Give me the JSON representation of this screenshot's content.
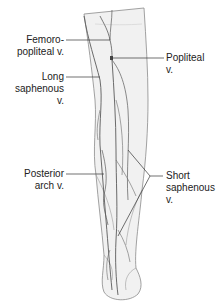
{
  "figure": {
    "type": "anatomical-diagram",
    "colors": {
      "background": "#ffffff",
      "leg_fill": "#f1f1f1",
      "outline": "#8a8a8a",
      "vein": "#5a5a5a",
      "leader_line": "#333333",
      "text": "#222222"
    }
  },
  "labels": {
    "femoropopliteal": {
      "line1": "Femoro-",
      "line2": "popliteal v."
    },
    "long_saphenous": {
      "line1": "Long",
      "line2": "saphenous",
      "line3": "v."
    },
    "posterior_arch": {
      "line1": "Posterior",
      "line2": "arch v."
    },
    "popliteal": {
      "line1": "Popliteal",
      "line2": "v."
    },
    "short_saphenous": {
      "line1": "Short",
      "line2": "saphenous",
      "line3": "v."
    }
  }
}
